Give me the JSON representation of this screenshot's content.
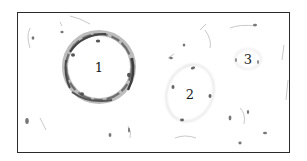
{
  "figure": {
    "border_color": "#2b2b2b",
    "background": "#ffffff",
    "clusters": [
      {
        "id": "1",
        "label": "1",
        "cx": 99,
        "cy": 67,
        "rx": 33,
        "ry": 34,
        "intensity": "strong"
      },
      {
        "id": "2",
        "label": "2",
        "cx": 190,
        "cy": 93,
        "rx": 23,
        "ry": 29,
        "intensity": "faint"
      },
      {
        "id": "3",
        "label": "3",
        "cx": 248,
        "cy": 59,
        "rx": 12,
        "ry": 10,
        "intensity": "very-faint"
      }
    ]
  }
}
